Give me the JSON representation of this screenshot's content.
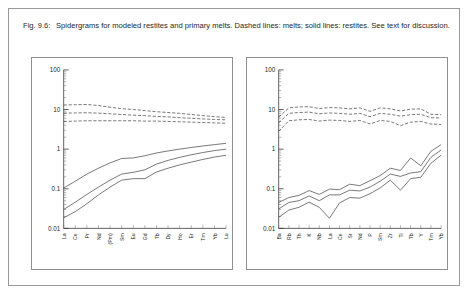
{
  "figure": {
    "label": "Fig. 9.6:",
    "caption": "Spidergrams for modeled restites and primary melts. Dashed lines: melts; solid lines: restites. See text for discussion."
  },
  "chart_data": [
    {
      "id": "left-panel",
      "type": "line",
      "title": "",
      "xlabel": "",
      "ylabel": "",
      "yscale": "log",
      "ylim": [
        0.01,
        100
      ],
      "ytick_labels": [
        "0.01",
        "0.1",
        "1",
        "10",
        "100"
      ],
      "ytick_values": [
        0.01,
        0.1,
        1,
        10,
        100
      ],
      "grid": false,
      "legend": "none",
      "categories": [
        "La",
        "Ce",
        "Pr",
        "Nd",
        "(Pm)",
        "Sm",
        "Eu",
        "Gd",
        "Tb",
        "Dy",
        "Ho",
        "Er",
        "Tm",
        "Yb",
        "Lu"
      ],
      "series": [
        {
          "name": "melt-upper",
          "style": "dashed",
          "values": [
            13.0,
            13.2,
            13.4,
            12.6,
            11.4,
            10.5,
            10.0,
            9.4,
            8.8,
            8.4,
            8.0,
            7.5,
            7.0,
            6.6,
            6.3
          ]
        },
        {
          "name": "melt-middle",
          "style": "dashed",
          "values": [
            8.1,
            8.2,
            8.3,
            8.1,
            7.8,
            7.5,
            7.2,
            7.0,
            6.7,
            6.5,
            6.2,
            6.0,
            5.8,
            5.6,
            5.5
          ]
        },
        {
          "name": "melt-lower",
          "style": "dashed",
          "values": [
            5.0,
            5.1,
            5.2,
            5.2,
            5.2,
            5.2,
            5.2,
            5.1,
            5.1,
            5.0,
            4.9,
            4.8,
            4.7,
            4.6,
            4.5
          ]
        },
        {
          "name": "restite-upper",
          "style": "solid",
          "values": [
            0.105,
            0.155,
            0.235,
            0.33,
            0.45,
            0.58,
            0.6,
            0.68,
            0.8,
            0.9,
            1.0,
            1.1,
            1.2,
            1.3,
            1.4
          ]
        },
        {
          "name": "restite-middle",
          "style": "solid",
          "values": [
            0.03,
            0.046,
            0.072,
            0.11,
            0.165,
            0.235,
            0.26,
            0.3,
            0.42,
            0.52,
            0.62,
            0.72,
            0.82,
            0.92,
            1.0
          ]
        },
        {
          "name": "restite-lower",
          "style": "solid",
          "values": [
            0.0185,
            0.0265,
            0.042,
            0.07,
            0.11,
            0.165,
            0.18,
            0.18,
            0.265,
            0.33,
            0.4,
            0.47,
            0.55,
            0.63,
            0.7
          ]
        }
      ]
    },
    {
      "id": "right-panel",
      "type": "line",
      "title": "",
      "xlabel": "",
      "ylabel": "",
      "yscale": "log",
      "ylim": [
        0.01,
        100
      ],
      "ytick_labels": [
        "0.01",
        "0.1",
        "1",
        "10",
        "100"
      ],
      "ytick_values": [
        0.01,
        0.1,
        1,
        10,
        100
      ],
      "grid": false,
      "legend": "none",
      "categories": [
        "Ba",
        "Rb",
        "Th",
        "K",
        "Nb",
        "La",
        "Ce",
        "Sr",
        "Nd",
        "P",
        "Sm",
        "Zr",
        "Ti",
        "Tb",
        "Y",
        "Tm",
        "Yb"
      ],
      "series": [
        {
          "name": "melt-upper",
          "style": "dashed",
          "values": [
            6.4,
            11.0,
            11.6,
            11.8,
            10.6,
            11.2,
            11.0,
            10.4,
            11.0,
            9.0,
            11.0,
            10.4,
            9.2,
            10.2,
            10.4,
            7.6,
            7.4
          ]
        },
        {
          "name": "melt-middle",
          "style": "dashed",
          "values": [
            4.6,
            8.0,
            8.4,
            8.6,
            7.8,
            8.2,
            8.0,
            7.6,
            8.0,
            6.6,
            8.0,
            7.6,
            6.8,
            7.4,
            7.6,
            6.2,
            6.1
          ]
        },
        {
          "name": "melt-lower",
          "style": "dashed",
          "values": [
            2.8,
            5.2,
            5.5,
            5.6,
            5.1,
            5.4,
            5.3,
            5.0,
            5.3,
            4.3,
            5.3,
            5.0,
            3.9,
            4.8,
            5.0,
            4.3,
            4.2
          ]
        },
        {
          "name": "restite-upper",
          "style": "solid",
          "values": [
            0.045,
            0.06,
            0.068,
            0.09,
            0.072,
            0.098,
            0.095,
            0.13,
            0.12,
            0.16,
            0.215,
            0.33,
            0.29,
            0.6,
            0.38,
            0.88,
            1.3
          ]
        },
        {
          "name": "restite-middle",
          "style": "solid",
          "values": [
            0.031,
            0.045,
            0.05,
            0.066,
            0.05,
            0.07,
            0.07,
            0.092,
            0.088,
            0.11,
            0.155,
            0.235,
            0.205,
            0.25,
            0.27,
            0.62,
            0.95
          ]
        },
        {
          "name": "restite-lower",
          "style": "solid",
          "values": [
            0.019,
            0.029,
            0.034,
            0.046,
            0.034,
            0.018,
            0.044,
            0.06,
            0.058,
            0.075,
            0.105,
            0.165,
            0.092,
            0.18,
            0.195,
            0.44,
            0.7
          ]
        }
      ]
    }
  ]
}
